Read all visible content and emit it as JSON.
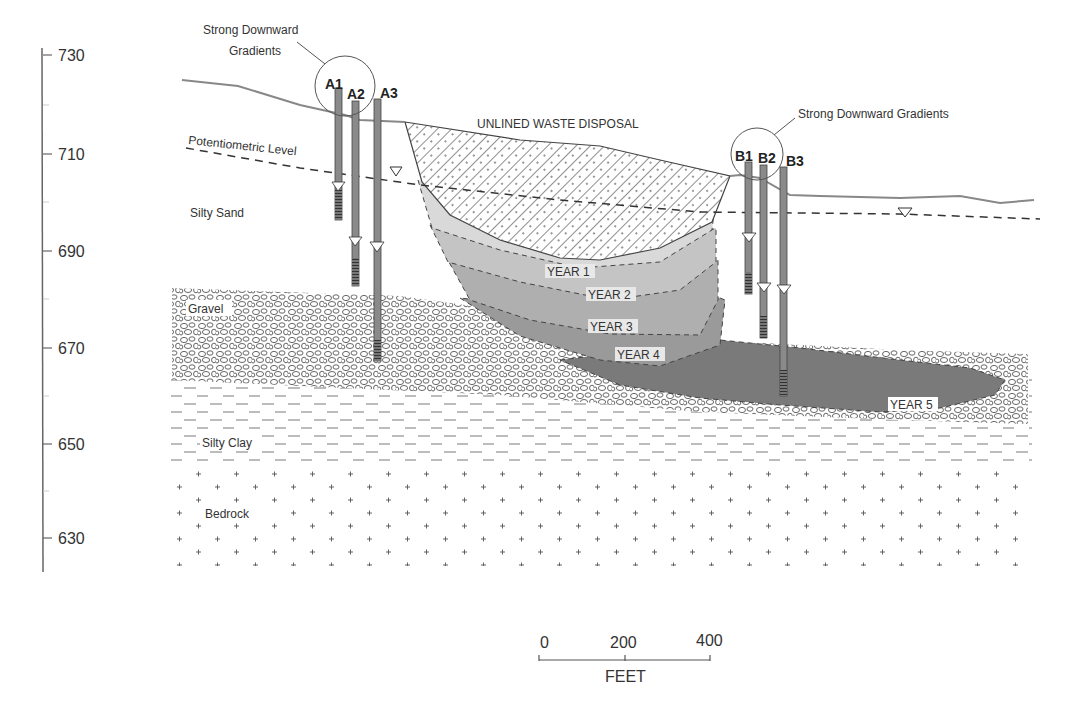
{
  "diagram": {
    "title": "",
    "elevation_axis": {
      "ticks": [
        {
          "value": "730",
          "y": 55
        },
        {
          "value": "710",
          "y": 154
        },
        {
          "value": "690",
          "y": 251
        },
        {
          "value": "670",
          "y": 348
        },
        {
          "value": "650",
          "y": 444
        },
        {
          "value": "630",
          "y": 538
        }
      ],
      "minor_ticks_y": [
        105,
        202,
        299,
        396,
        491
      ]
    },
    "annotations": {
      "strong_gradients_a_line1": "Strong Downward",
      "strong_gradients_a_line2": "Gradients",
      "strong_gradients_b": "Strong Downward Gradients",
      "waste_disposal": "UNLINED WASTE DISPOSAL",
      "potentiometric_level": "Potentiometric Level"
    },
    "layers": {
      "silty_sand": "Silty Sand",
      "gravel": "Gravel",
      "silty_clay": "Silty Clay",
      "bedrock": "Bedrock"
    },
    "plume_years": [
      "YEAR 1",
      "YEAR 2",
      "YEAR 3",
      "YEAR 4",
      "YEAR 5"
    ],
    "wells": {
      "a1": "A1",
      "a2": "A2",
      "a3": "A3",
      "b1": "B1",
      "b2": "B2",
      "b3": "B3"
    },
    "scale_bar": {
      "labels": [
        "0",
        "200",
        "400"
      ],
      "unit": "FEET"
    },
    "colors": {
      "line": "#555555",
      "year1": "#d9d9d9",
      "year2": "#c4c4c4",
      "year3": "#afafaf",
      "year4": "#9a9a9a",
      "year5": "#7a7a7a",
      "well": "#8a8a8a"
    }
  }
}
